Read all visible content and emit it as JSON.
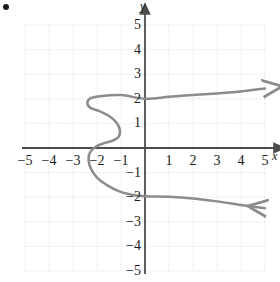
{
  "figure": {
    "bullet": "•",
    "axis_labels": {
      "x": "x",
      "y": "y"
    },
    "colors": {
      "curve": "#8c8c8c",
      "axis": "#4d4d4d",
      "grid": "#cccccc",
      "text": "#1a1a1a",
      "background": "#ffffff"
    }
  },
  "chart_data": {
    "type": "line",
    "title": "",
    "xlabel": "x",
    "ylabel": "y",
    "xlim": [
      -5,
      5
    ],
    "ylim": [
      -5,
      5
    ],
    "xticks": [
      -5,
      -4,
      -3,
      -2,
      -1,
      1,
      2,
      3,
      4,
      5
    ],
    "yticks": [
      5,
      4,
      3,
      2,
      1,
      -1,
      -2,
      -3,
      -4,
      -5
    ],
    "xtick_labels": [
      "−5",
      "−4",
      "−3",
      "−2",
      "−1",
      "1",
      "2",
      "3",
      "4",
      "5"
    ],
    "ytick_labels": [
      "5",
      "4",
      "3",
      "2",
      "1",
      "−1",
      "−2",
      "−3",
      "−4",
      "−5"
    ],
    "grid": true,
    "grid_style": "dotted",
    "grid_spacing": 1,
    "legend": null,
    "annotations": [],
    "series": [
      {
        "name": "sideways cubic",
        "orientation": "x-as-function-of-y",
        "arrow_start": true,
        "arrow_end": true,
        "points": [
          [
            5.0,
            -2.45
          ],
          [
            4.0,
            -2.32
          ],
          [
            3.0,
            -2.17
          ],
          [
            2.0,
            -2.05
          ],
          [
            1.0,
            -1.98
          ],
          [
            0.0,
            -1.96
          ],
          [
            -0.55,
            -1.9
          ],
          [
            -1.1,
            -1.75
          ],
          [
            -1.6,
            -1.5
          ],
          [
            -2.0,
            -1.2
          ],
          [
            -2.25,
            -0.85
          ],
          [
            -2.35,
            -0.5
          ],
          [
            -2.3,
            -0.2
          ],
          [
            -2.05,
            0.05
          ],
          [
            -1.7,
            0.2
          ],
          [
            -1.35,
            0.3
          ],
          [
            -1.1,
            0.45
          ],
          [
            -1.05,
            0.75
          ],
          [
            -1.2,
            1.05
          ],
          [
            -1.5,
            1.3
          ],
          [
            -1.9,
            1.5
          ],
          [
            -2.25,
            1.62
          ],
          [
            -2.4,
            1.8
          ],
          [
            -2.3,
            2.0
          ],
          [
            -1.9,
            2.1
          ],
          [
            -1.0,
            2.15
          ],
          [
            0.0,
            2.0
          ],
          [
            1.0,
            2.08
          ],
          [
            2.0,
            2.15
          ],
          [
            3.0,
            2.22
          ],
          [
            4.0,
            2.3
          ],
          [
            5.0,
            2.42
          ]
        ]
      }
    ]
  }
}
